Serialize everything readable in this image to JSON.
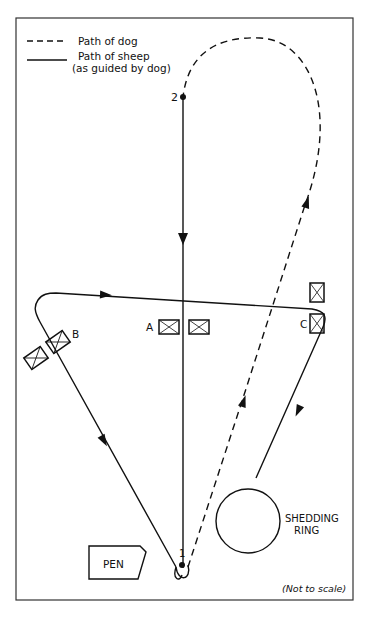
{
  "legend": {
    "dog_label": "Path of dog",
    "sheep_label_1": "Path of sheep",
    "sheep_label_2": "(as guided by dog)"
  },
  "points": {
    "start": "1",
    "turn": "2"
  },
  "obstacles": {
    "a": "A",
    "b": "B",
    "c": "C"
  },
  "pen_label": "PEN",
  "shedding_ring": {
    "line1": "SHEDDING",
    "line2": "RING"
  },
  "note": "(Not to scale)",
  "colors": {
    "ink": "#111111",
    "border": "#333333",
    "background": "#ffffff"
  }
}
